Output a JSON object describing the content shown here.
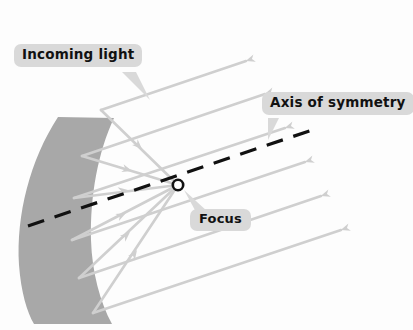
{
  "figure": {
    "background_color": "#fdfdfd",
    "mirror_color": "#a8a8a8",
    "ray_color": "#cfcfcf",
    "axis_color": "#111111",
    "focus_marker_color": "#111111",
    "callout_bg_color": "#d9d9d9",
    "callout_text_color": "#111111"
  },
  "labels": {
    "incoming_light": "Incoming light",
    "axis_of_symmetry": "Axis of symmetry",
    "focus": "Focus"
  },
  "geometry": {
    "focus_point": {
      "x": 178,
      "y": 185
    },
    "axis_start": {
      "x": 28,
      "y": 226
    },
    "axis_end": {
      "x": 318,
      "y": 128
    },
    "incoming_ray_direction": "right-to-left, arrowheads pointing left toward the mirror",
    "reflected_ray_direction": "from mirror surface converging to the focus",
    "mirror_shape": "parabolic band opening to the right, tilted",
    "incoming_ray_count": 6,
    "reflected_ray_count": 6
  }
}
